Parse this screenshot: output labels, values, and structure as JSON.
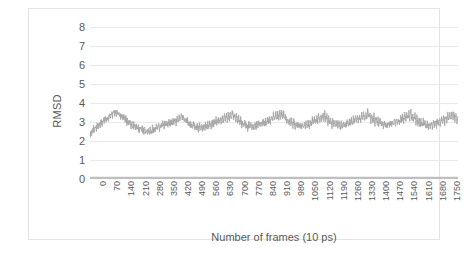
{
  "chart_data": {
    "type": "line",
    "title": "",
    "xlabel": "Number of frames (10 ps)",
    "ylabel": "RMSD",
    "xlim": [
      0,
      1800
    ],
    "ylim": [
      0,
      8
    ],
    "ytick_step": 1,
    "xtick_step": 70,
    "grid": true,
    "legend": "none",
    "yticks": [
      "0",
      "1",
      "2",
      "3",
      "4",
      "5",
      "6",
      "7",
      "8"
    ],
    "xticks": [
      "0",
      "70",
      "140",
      "210",
      "280",
      "350",
      "420",
      "490",
      "560",
      "630",
      "700",
      "770",
      "840",
      "910",
      "980",
      "1050",
      "1120",
      "1190",
      "1260",
      "1330",
      "1400",
      "1470",
      "1540",
      "1610",
      "1680",
      "1750"
    ],
    "colors": {
      "series": "#a6a6a6",
      "baseline": "#bfbfbf",
      "gridline": "#e9e9e9",
      "axis": "#d9d9d9",
      "text": "#595959",
      "border": "#e3e3e3",
      "background": "#ffffff"
    },
    "series": [
      {
        "name": "RMSD",
        "color": "#a6a6a6",
        "x_start": 0,
        "x_end": 1800,
        "mean": 2.9,
        "min": 2.2,
        "max": 3.8,
        "values": [
          2.3,
          2.42,
          2.55,
          2.68,
          2.5,
          2.75,
          2.62,
          2.88,
          2.7,
          2.95,
          2.8,
          3.05,
          2.9,
          3.18,
          3.0,
          3.28,
          3.1,
          3.35,
          3.18,
          3.42,
          3.25,
          3.5,
          3.3,
          3.58,
          3.36,
          3.62,
          3.4,
          3.55,
          3.3,
          3.45,
          3.22,
          3.38,
          3.15,
          3.3,
          3.05,
          3.22,
          2.98,
          3.12,
          2.88,
          3.05,
          2.8,
          2.96,
          2.72,
          2.88,
          2.66,
          2.82,
          2.6,
          2.76,
          2.55,
          2.7,
          2.52,
          2.66,
          2.48,
          2.62,
          2.45,
          2.6,
          2.44,
          2.58,
          2.46,
          2.62,
          2.5,
          2.66,
          2.55,
          2.7,
          2.6,
          2.76,
          2.64,
          2.8,
          2.68,
          2.85,
          2.72,
          2.9,
          2.76,
          2.94,
          2.8,
          2.98,
          2.84,
          3.02,
          2.88,
          3.06,
          2.92,
          3.12,
          2.96,
          3.18,
          3.0,
          3.24,
          3.05,
          3.3,
          3.1,
          3.36,
          3.14,
          3.3,
          3.05,
          3.2,
          2.96,
          3.1,
          2.88,
          3.02,
          2.8,
          2.95,
          2.74,
          2.9,
          2.7,
          2.86,
          2.66,
          2.82,
          2.62,
          2.8,
          2.6,
          2.78,
          2.62,
          2.82,
          2.66,
          2.86,
          2.7,
          2.9,
          2.74,
          2.95,
          2.78,
          3.0,
          2.82,
          3.06,
          2.86,
          3.12,
          2.9,
          3.18,
          2.94,
          3.22,
          2.98,
          3.28,
          3.02,
          3.34,
          3.06,
          3.4,
          3.1,
          3.46,
          3.14,
          3.52,
          3.18,
          3.56,
          3.12,
          3.44,
          3.04,
          3.34,
          2.96,
          3.24,
          2.88,
          3.14,
          2.82,
          3.06,
          2.76,
          3.0,
          2.72,
          2.94,
          2.68,
          2.9,
          2.66,
          2.86,
          2.64,
          2.84,
          2.66,
          2.88,
          2.7,
          2.92,
          2.74,
          2.98,
          2.78,
          3.04,
          2.82,
          3.1,
          2.86,
          3.16,
          2.9,
          3.22,
          2.94,
          3.28,
          2.98,
          3.34,
          3.02,
          3.4,
          3.06,
          3.46,
          3.1,
          3.52,
          3.14,
          3.58,
          3.18,
          3.62,
          3.12,
          3.5,
          3.04,
          3.38,
          2.96,
          3.28,
          2.9,
          3.18,
          2.84,
          3.1,
          2.8,
          3.04,
          2.76,
          2.98,
          2.72,
          2.94,
          2.7,
          2.9,
          2.68,
          2.88,
          2.7,
          2.92,
          2.74,
          2.96,
          2.78,
          3.02,
          2.82,
          3.08,
          2.86,
          3.14,
          2.9,
          3.2,
          2.94,
          3.26,
          2.98,
          3.32,
          3.02,
          3.38,
          3.06,
          3.44,
          3.1,
          3.48,
          3.04,
          3.38,
          2.96,
          3.28,
          2.9,
          3.18,
          2.84,
          3.1,
          2.78,
          3.02,
          2.74,
          2.96,
          2.7,
          2.92,
          2.68,
          2.9,
          2.7,
          2.94,
          2.74,
          2.98,
          2.78,
          3.04,
          2.82,
          3.1,
          2.86,
          3.16,
          2.9,
          3.22,
          2.94,
          3.28,
          2.98,
          3.34,
          3.02,
          3.4,
          3.06,
          3.46,
          3.1,
          3.52,
          3.14,
          3.58,
          3.18,
          3.62,
          3.14,
          3.52,
          3.06,
          3.42,
          2.98,
          3.32,
          2.92,
          3.22,
          2.86,
          3.14,
          2.8,
          3.06,
          2.76,
          3.0,
          2.72,
          2.94,
          2.7,
          2.9,
          2.72,
          2.94,
          2.76,
          3.0,
          2.8,
          3.06,
          2.84,
          3.12,
          2.88,
          3.18,
          2.92,
          3.24,
          2.96,
          3.3,
          3.0,
          3.36,
          3.04,
          3.42,
          3.08,
          3.48,
          3.12,
          3.54,
          3.16,
          3.6,
          3.1,
          3.5,
          3.02,
          3.4,
          2.94,
          3.3,
          2.88,
          3.2,
          2.82,
          3.12,
          2.78,
          3.06,
          2.74,
          3.0,
          2.7,
          2.96,
          2.68,
          2.92,
          2.7,
          2.96,
          2.74,
          3.0,
          2.78,
          3.06,
          2.82,
          3.12,
          2.86,
          3.18,
          2.9,
          3.24,
          2.94,
          3.3,
          2.98,
          3.36,
          3.02,
          3.42,
          3.06,
          3.48,
          3.1,
          3.54,
          3.14,
          3.58,
          3.08,
          3.48,
          3.0,
          3.38
        ]
      },
      {
        "name": "baseline",
        "color": "#bfbfbf",
        "constant": 0.06
      }
    ]
  }
}
